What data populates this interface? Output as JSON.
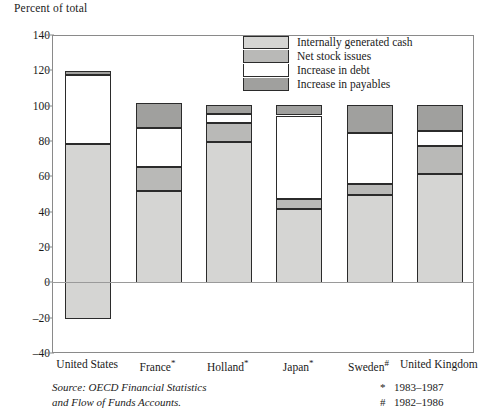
{
  "axis_title": "Percent of total",
  "legend": {
    "items": [
      {
        "label": "Internally generated cash",
        "key": "cash",
        "color": "#d5d5d3"
      },
      {
        "label": "Net stock issues",
        "key": "stock",
        "color": "#b9b9b7"
      },
      {
        "label": "Increase in debt",
        "key": "debt",
        "color": "#ffffff"
      },
      {
        "label": "Increase in payables",
        "key": "pay",
        "color": "#a0a09e"
      }
    ]
  },
  "source": {
    "line1": "Source: OECD Financial Statistics",
    "line2": "and Flow of Funds Accounts."
  },
  "notes": [
    {
      "symbol": "*",
      "text": "1983–1987"
    },
    {
      "symbol": "#",
      "text": "1982–1986"
    }
  ],
  "chart_data": {
    "type": "bar",
    "stacked": true,
    "title": "",
    "xlabel": "",
    "ylabel": "Percent of total",
    "ylim": [
      -40,
      140
    ],
    "yticks": [
      140,
      120,
      100,
      80,
      60,
      40,
      20,
      0,
      -20,
      -40
    ],
    "ytick_labels": [
      "140",
      "120",
      "100",
      "80",
      "60",
      "40",
      "20",
      "0",
      "–20",
      "–40"
    ],
    "grid": false,
    "legend_position": "inside-top-center",
    "categories": [
      "United States",
      "France*",
      "Holland*",
      "Japan*",
      "Sweden#",
      "United Kingdom"
    ],
    "category_labels": [
      {
        "name": "United States",
        "note": ""
      },
      {
        "name": "France",
        "note": "*"
      },
      {
        "name": "Holland",
        "note": "*"
      },
      {
        "name": "Japan",
        "note": "*"
      },
      {
        "name": "Sweden",
        "note": "#"
      },
      {
        "name": "United Kingdom",
        "note": ""
      }
    ],
    "series": [
      {
        "name": "Internally generated cash",
        "key": "cash",
        "color": "#d5d5d3",
        "values": [
          99,
          52,
          80,
          42,
          50,
          62
        ]
      },
      {
        "name": "Net stock issues",
        "key": "stock",
        "color": "#b9b9b7",
        "values": [
          0,
          14,
          11,
          6,
          6,
          16
        ]
      },
      {
        "name": "Increase in debt",
        "key": "debt",
        "color": "#ffffff",
        "values": [
          39,
          22,
          5,
          47,
          29,
          8
        ]
      },
      {
        "name": "Increase in payables",
        "key": "pay",
        "color": "#a0a09e",
        "values": [
          2,
          14,
          5,
          6,
          16,
          15
        ]
      }
    ],
    "bars": [
      {
        "category": "United States",
        "base": -20,
        "segments": [
          {
            "key": "cash",
            "from": -20,
            "to": 79
          },
          {
            "key": "debt",
            "from": 79,
            "to": 118
          },
          {
            "key": "pay",
            "from": 118,
            "to": 120
          }
        ],
        "total": 120
      },
      {
        "category": "France*",
        "base": 0,
        "segments": [
          {
            "key": "cash",
            "from": 0,
            "to": 52
          },
          {
            "key": "stock",
            "from": 52,
            "to": 66
          },
          {
            "key": "debt",
            "from": 66,
            "to": 88
          },
          {
            "key": "pay",
            "from": 88,
            "to": 102
          }
        ],
        "total": 102
      },
      {
        "category": "Holland*",
        "base": 0,
        "segments": [
          {
            "key": "cash",
            "from": 0,
            "to": 80
          },
          {
            "key": "stock",
            "from": 80,
            "to": 91
          },
          {
            "key": "debt",
            "from": 91,
            "to": 96
          },
          {
            "key": "pay",
            "from": 96,
            "to": 101
          }
        ],
        "total": 101
      },
      {
        "category": "Japan*",
        "base": 0,
        "segments": [
          {
            "key": "cash",
            "from": 0,
            "to": 42
          },
          {
            "key": "stock",
            "from": 42,
            "to": 48
          },
          {
            "key": "debt",
            "from": 48,
            "to": 95
          },
          {
            "key": "pay",
            "from": 95,
            "to": 101
          }
        ],
        "total": 101
      },
      {
        "category": "Sweden#",
        "base": 0,
        "segments": [
          {
            "key": "cash",
            "from": 0,
            "to": 50
          },
          {
            "key": "stock",
            "from": 50,
            "to": 56
          },
          {
            "key": "debt",
            "from": 56,
            "to": 85
          },
          {
            "key": "pay",
            "from": 85,
            "to": 101
          }
        ],
        "total": 101
      },
      {
        "category": "United Kingdom",
        "base": 0,
        "segments": [
          {
            "key": "cash",
            "from": 0,
            "to": 62
          },
          {
            "key": "stock",
            "from": 62,
            "to": 78
          },
          {
            "key": "debt",
            "from": 78,
            "to": 86
          },
          {
            "key": "pay",
            "from": 86,
            "to": 101
          }
        ],
        "total": 101
      }
    ]
  }
}
